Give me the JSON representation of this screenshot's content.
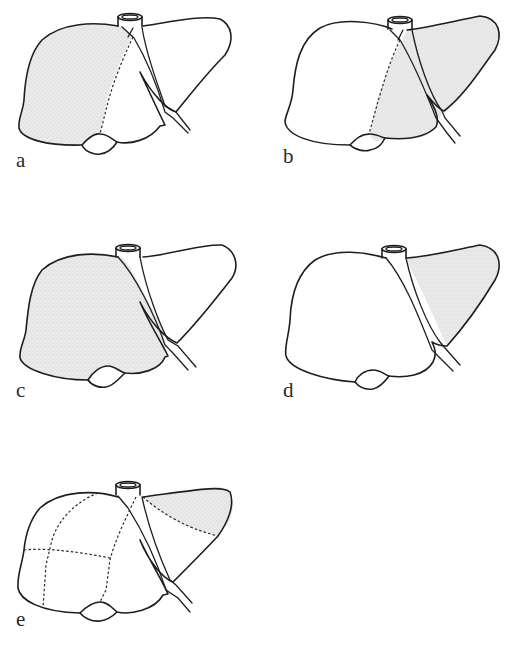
{
  "figure": {
    "panels": [
      {
        "id": "a",
        "label": "a",
        "shaded_region": "right hemiliver (right of dashed Cantlie line)",
        "dashed_lines": "principal plane (Cantlie line)"
      },
      {
        "id": "b",
        "label": "b",
        "shaded_region": "left hemiliver (left lobe plus segment IV)",
        "dashed_lines": "principal plane (Cantlie line)"
      },
      {
        "id": "c",
        "label": "c",
        "shaded_region": "extended right liver (right of falciform ligament)",
        "dashed_lines": "none"
      },
      {
        "id": "d",
        "label": "d",
        "shaded_region": "left lateral lobe (left of falciform ligament)",
        "dashed_lines": "none"
      },
      {
        "id": "e",
        "label": "e",
        "shaded_region": "upper part of left lateral section",
        "dashed_lines": "segmental boundaries"
      }
    ],
    "colors": {
      "outline": "#1e1e1e",
      "shading": "#e4e4e4",
      "background": "#ffffff",
      "label": "#2a2a2a"
    },
    "icons": {
      "vena-cava": "cylinder at top of liver",
      "gallbladder": "rounded bulge at inferior margin",
      "falciform-ligament": "double line running from vena cava to inferior margin"
    }
  }
}
